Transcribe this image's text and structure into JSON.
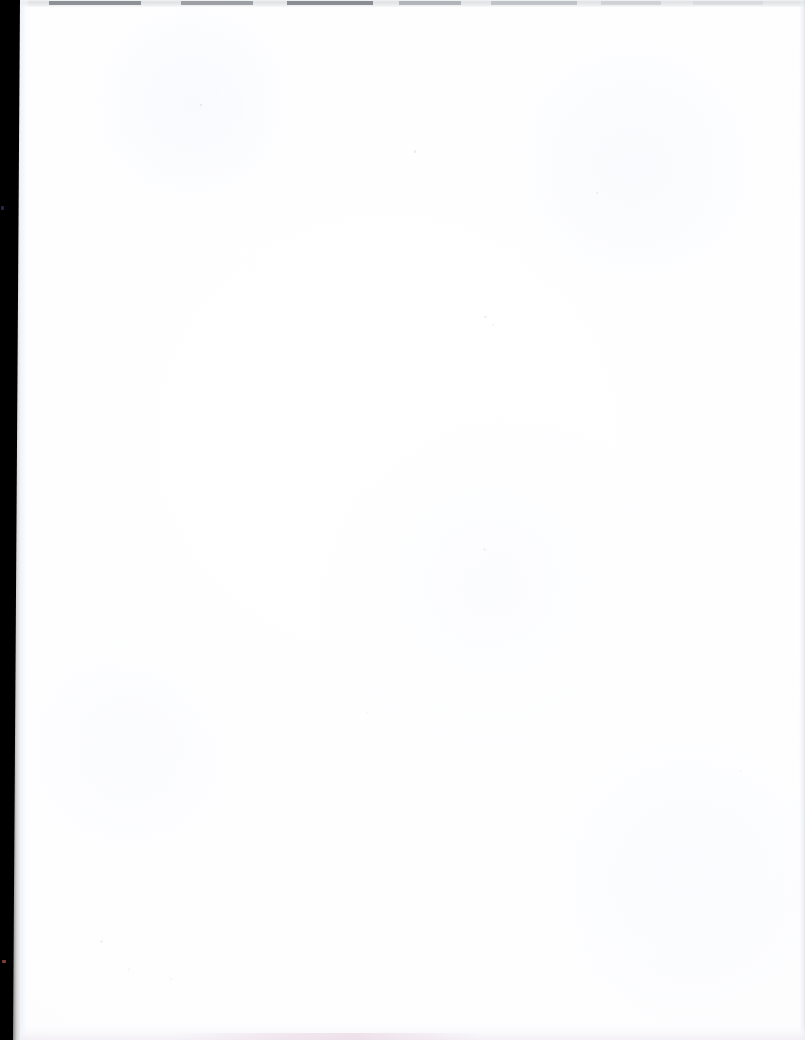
{
  "page": {
    "kind": "scanned-document-page",
    "content_state": "blank",
    "width": 805,
    "height": 1040,
    "visible_text": "",
    "caption": ""
  },
  "colors": {
    "paper": "#ffffff",
    "paper_tint": "#fdfdfe",
    "gutter_band": "#000000",
    "top_edge_rule": "#dfe1e4",
    "top_edge_segment": "#787c82",
    "right_edge_line": "#dee1e6",
    "bottom_edge_band": "#f1eef4",
    "bottom_edge_tint": "#e9d4e2",
    "speck": "#d2d4da",
    "speck_red": "#96463e",
    "speck_blue": "#243056"
  },
  "regions": {
    "gutter_band": {
      "name": "left-gutter-shadow",
      "top_width_px": 20,
      "bottom_width_px": 13,
      "height_px": 1040
    },
    "top_edge": {
      "name": "top-scan-edge",
      "height_px": 7
    },
    "right_edge": {
      "name": "right-scan-edge",
      "width_px": 6
    },
    "bottom_edge": {
      "name": "bottom-scan-edge",
      "height_px": 16
    },
    "paper_field": {
      "name": "blank-paper-field",
      "left_px": 21,
      "top_px": 7,
      "right_px": 805,
      "bottom_px": 1024
    }
  },
  "specks": [
    {
      "id": "a",
      "x": 200,
      "y": 104
    },
    {
      "id": "b",
      "x": 414,
      "y": 150
    },
    {
      "id": "c",
      "x": 596,
      "y": 192
    },
    {
      "id": "d",
      "x": 484,
      "y": 316
    },
    {
      "id": "e",
      "x": 492,
      "y": 324
    },
    {
      "id": "f",
      "x": 483,
      "y": 548
    },
    {
      "id": "g",
      "x": 100,
      "y": 940
    },
    {
      "id": "h",
      "x": 128,
      "y": 968
    },
    {
      "id": "i",
      "x": 170,
      "y": 978
    },
    {
      "id": "j",
      "x": 366,
      "y": 712
    },
    {
      "id": "k",
      "x": 740,
      "y": 770
    },
    {
      "id": "red",
      "x": 2,
      "y": 960
    },
    {
      "id": "blue",
      "x": 1,
      "y": 206
    }
  ]
}
